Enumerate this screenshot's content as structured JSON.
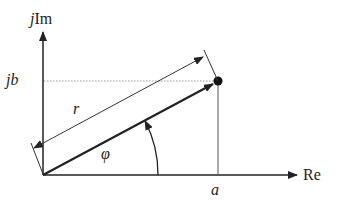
{
  "diagram": {
    "type": "complex-plane-phasor",
    "labels": {
      "imag_axis_j": "j",
      "imag_axis_im": "Im",
      "real_axis": "Re",
      "imag_value": "jb",
      "real_value": "a",
      "magnitude": "r",
      "angle": "φ"
    },
    "colors": {
      "line": "#222222",
      "dotted_guide": "#999999",
      "background": "#ffffff"
    }
  }
}
